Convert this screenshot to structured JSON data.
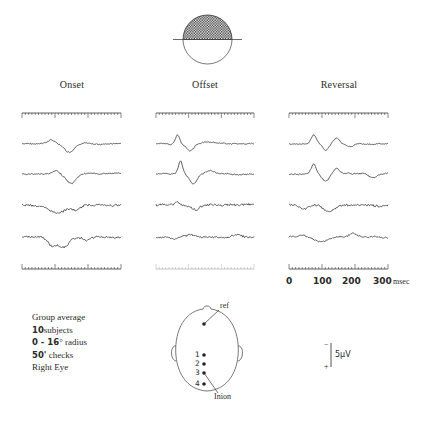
{
  "figure": {
    "stimulus_icon": "half-field-checkerboard-circle-upper",
    "columns": [
      {
        "id": "onset",
        "title": "Onset"
      },
      {
        "id": "offset",
        "title": "Offset"
      },
      {
        "id": "reversal",
        "title": "Reversal"
      }
    ],
    "time_axis": {
      "ticks": [
        "0",
        "100",
        "200",
        "300"
      ],
      "unit": "msec",
      "range_ms": [
        0,
        300
      ],
      "minor_ticks_per_major": 10
    },
    "legend": {
      "line1": "Group average",
      "line2_num": "10",
      "line2_text": "subjects",
      "line3_num": "0 - 16",
      "line3_text": "° radius",
      "line4_num": "50'",
      "line4_text": " checks",
      "line5": "Right Eye"
    },
    "head_diagram": {
      "ref_label": "ref",
      "inion_label": "Inion",
      "electrodes": [
        "1",
        "2",
        "3",
        "4"
      ]
    },
    "amplitude_scale": {
      "minus": "−",
      "plus": "+",
      "label": "5μV"
    },
    "colors": {
      "ink": "#3a3a3a",
      "background": "#ffffff"
    }
  }
}
